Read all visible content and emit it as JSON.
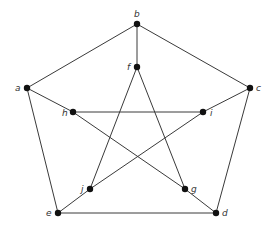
{
  "diagram": {
    "type": "graph",
    "name": "Petersen graph",
    "edge_color": "#3a3a3a",
    "node_color": "#111111",
    "label_color": "#333333",
    "nodes": [
      {
        "id": "a",
        "label": "a",
        "x": 27,
        "y": 88,
        "label_dx": -12,
        "label_dy": 3
      },
      {
        "id": "b",
        "label": "b",
        "x": 137,
        "y": 24,
        "label_dx": -3,
        "label_dy": -7
      },
      {
        "id": "c",
        "label": "c",
        "x": 250,
        "y": 88,
        "label_dx": 6,
        "label_dy": 3
      },
      {
        "id": "d",
        "label": "d",
        "x": 216,
        "y": 213,
        "label_dx": 6,
        "label_dy": 3
      },
      {
        "id": "e",
        "label": "e",
        "x": 58,
        "y": 213,
        "label_dx": -12,
        "label_dy": 3
      },
      {
        "id": "f",
        "label": "f",
        "x": 137,
        "y": 67,
        "label_dx": -10,
        "label_dy": 3
      },
      {
        "id": "g",
        "label": "g",
        "x": 185,
        "y": 189,
        "label_dx": 6,
        "label_dy": 3
      },
      {
        "id": "h",
        "label": "h",
        "x": 73,
        "y": 112,
        "label_dx": -11,
        "label_dy": 4
      },
      {
        "id": "i",
        "label": "i",
        "x": 203,
        "y": 112,
        "label_dx": 7,
        "label_dy": 4
      },
      {
        "id": "j",
        "label": "j",
        "x": 90,
        "y": 189,
        "label_dx": -9,
        "label_dy": 3
      }
    ],
    "edges": [
      [
        "a",
        "b"
      ],
      [
        "b",
        "c"
      ],
      [
        "c",
        "d"
      ],
      [
        "d",
        "e"
      ],
      [
        "e",
        "a"
      ],
      [
        "b",
        "f"
      ],
      [
        "a",
        "h"
      ],
      [
        "c",
        "i"
      ],
      [
        "e",
        "j"
      ],
      [
        "d",
        "g"
      ],
      [
        "f",
        "j"
      ],
      [
        "f",
        "g"
      ],
      [
        "h",
        "i"
      ],
      [
        "h",
        "g"
      ],
      [
        "i",
        "j"
      ]
    ]
  }
}
